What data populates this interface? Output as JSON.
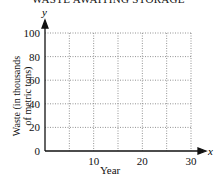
{
  "chart_data": {
    "type": "line",
    "title": "WASTE AWAITING STORAGE",
    "xlabel": "Year",
    "ylabel": "Waste (in thousands of metric tons)",
    "ylabel_line1": "Waste (in thousands",
    "ylabel_line2": "of metric tons)",
    "x_axis_var": "x",
    "y_axis_var": "y",
    "xlim": [
      0,
      30
    ],
    "ylim": [
      0,
      100
    ],
    "x_ticks": [
      "10",
      "20",
      "30"
    ],
    "y_ticks": [
      "0",
      "20",
      "40",
      "60",
      "80",
      "100"
    ],
    "x_grid_step": 5,
    "y_grid_step": 20,
    "grid": "dotted",
    "series": []
  }
}
